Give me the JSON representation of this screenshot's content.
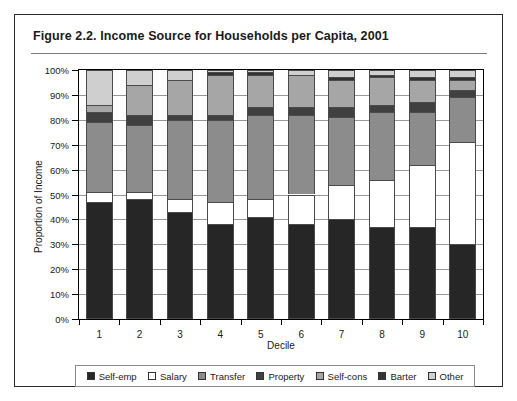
{
  "figure": {
    "title": "Figure 2.2.  Income Source for Households per Capita, 2001"
  },
  "axes": {
    "y_title": "Proportion of Income",
    "x_title": "Decile",
    "y_ticks": [
      "0%",
      "10%",
      "20%",
      "30%",
      "40%",
      "50%",
      "60%",
      "70%",
      "80%",
      "90%",
      "100%"
    ],
    "x_ticks": [
      "1",
      "2",
      "3",
      "4",
      "5",
      "6",
      "7",
      "8",
      "9",
      "10"
    ]
  },
  "legend": {
    "items": [
      {
        "label": "Self-emp",
        "color": "#262626"
      },
      {
        "label": "Salary",
        "color": "#ffffff"
      },
      {
        "label": "Transfer",
        "color": "#8c8c8c"
      },
      {
        "label": "Property",
        "color": "#404040"
      },
      {
        "label": "Self-cons",
        "color": "#a6a6a6"
      },
      {
        "label": "Barter",
        "color": "#333333"
      },
      {
        "label": "Other",
        "color": "#cfcfcf"
      }
    ]
  },
  "chart_data": {
    "type": "bar",
    "subtype": "stacked-percent",
    "title": "Income Source for Households per Capita, 2001",
    "xlabel": "Decile",
    "ylabel": "Proportion of Income",
    "ylim": [
      0,
      100
    ],
    "ytick_step": 10,
    "grid": true,
    "legend_position": "bottom",
    "categories": [
      "1",
      "2",
      "3",
      "4",
      "5",
      "6",
      "7",
      "8",
      "9",
      "10"
    ],
    "series": [
      {
        "name": "Self-emp",
        "color": "#262626",
        "values": [
          47,
          48,
          43,
          38,
          41,
          38,
          40,
          37,
          37,
          30
        ]
      },
      {
        "name": "Salary",
        "color": "#ffffff",
        "values": [
          4,
          3,
          5,
          9,
          7,
          12,
          14,
          19,
          25,
          41
        ]
      },
      {
        "name": "Transfer",
        "color": "#8c8c8c",
        "values": [
          28,
          27,
          32,
          33,
          34,
          32,
          27,
          27,
          21,
          18
        ]
      },
      {
        "name": "Property",
        "color": "#404040",
        "values": [
          4,
          4,
          2,
          2,
          3,
          3,
          4,
          3,
          4,
          3
        ]
      },
      {
        "name": "Self-cons",
        "color": "#a6a6a6",
        "values": [
          3,
          12,
          14,
          16,
          13,
          13,
          11,
          11,
          9,
          4
        ]
      },
      {
        "name": "Barter",
        "color": "#333333",
        "values": [
          0,
          0,
          0,
          1,
          1,
          0,
          1,
          1,
          1,
          1
        ]
      },
      {
        "name": "Other",
        "color": "#cfcfcf",
        "values": [
          14,
          6,
          4,
          1,
          1,
          2,
          3,
          2,
          3,
          3
        ]
      }
    ]
  }
}
